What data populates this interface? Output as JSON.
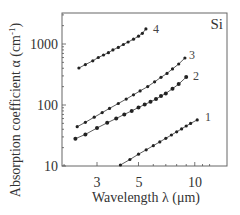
{
  "chart_data": {
    "type": "line",
    "title": "",
    "material_label": "Si",
    "xlabel": "Wavelength λ (μm)",
    "ylabel": "Absorption coefficient α (cm⁻¹)",
    "xscale": "log",
    "yscale": "log",
    "xlim": [
      1.9,
      12.5
    ],
    "ylim": [
      10,
      3000
    ],
    "x_ticks": [
      3,
      5,
      10
    ],
    "x_tick_labels": [
      "3",
      "5",
      "10"
    ],
    "y_ticks": [
      10,
      100,
      1000
    ],
    "y_tick_labels": [
      "10",
      "100",
      "1000"
    ],
    "grid": false,
    "legend": "inline curve labels",
    "series": [
      {
        "name": "1",
        "x": [
          4.0,
          4.5,
          5.0,
          5.5,
          6.0,
          6.5,
          7.0,
          7.5,
          8.0,
          8.5,
          9.0,
          9.5,
          10.3
        ],
        "y": [
          10.4,
          12.8,
          15.6,
          18.4,
          21.5,
          24.8,
          28.4,
          32.2,
          36.3,
          40.6,
          45.2,
          50.0,
          57
        ]
      },
      {
        "name": "2",
        "x": [
          2.3,
          2.6,
          3.0,
          3.4,
          3.8,
          4.2,
          4.6,
          5.0,
          5.4,
          5.8,
          6.2,
          6.6,
          7.0,
          7.6,
          8.2,
          9.0
        ],
        "y": [
          28,
          33,
          42,
          51,
          60,
          70,
          80,
          91,
          102,
          113,
          125,
          140,
          155,
          185,
          220,
          287
        ]
      },
      {
        "name": "3",
        "x": [
          2.35,
          2.6,
          2.9,
          3.2,
          3.5,
          3.9,
          4.3,
          4.7,
          5.1,
          5.6,
          6.1,
          6.6,
          7.1,
          7.6,
          8.2,
          8.85
        ],
        "y": [
          44,
          52,
          63,
          75,
          88,
          106,
          125,
          147,
          170,
          200,
          240,
          285,
          330,
          390,
          470,
          590
        ]
      },
      {
        "name": "4",
        "x": [
          2.4,
          2.6,
          2.85,
          3.05,
          3.25,
          3.45,
          3.65,
          3.9,
          4.15,
          4.4,
          4.7,
          5.0,
          5.25,
          5.48
        ],
        "y": [
          404,
          460,
          530,
          600,
          660,
          720,
          800,
          880,
          980,
          1080,
          1200,
          1340,
          1500,
          1770
        ]
      }
    ]
  },
  "labels": {
    "material": "Si",
    "xlabel": "Wavelength λ (μm)",
    "ylabel_main": "Absorption coefficient α (cm",
    "ylabel_sup": "-1",
    "ylabel_close": ")",
    "curves": [
      "1",
      "2",
      "3",
      "4"
    ],
    "x_ticks": [
      "3",
      "5",
      "10"
    ],
    "y_ticks": [
      "1000",
      "100",
      "10"
    ]
  },
  "colors": {
    "axis": "#555555",
    "line": "#333333",
    "marker": "#222222"
  }
}
